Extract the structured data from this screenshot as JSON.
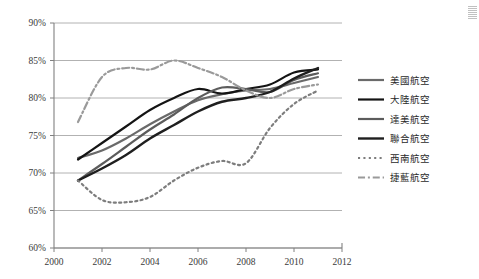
{
  "chart_data": {
    "type": "line",
    "title": "",
    "xlabel": "",
    "ylabel": "",
    "xlim": [
      2000,
      2012
    ],
    "ylim": [
      0.6,
      0.9
    ],
    "grid": true,
    "legend_position": "right",
    "x_ticks": [
      "2000",
      "2002",
      "2004",
      "2006",
      "2008",
      "2010",
      "2012"
    ],
    "x_tick_values": [
      2000,
      2002,
      2004,
      2006,
      2008,
      2010,
      2012
    ],
    "y_ticks": [
      "60%",
      "65%",
      "70%",
      "75%",
      "80%",
      "85%",
      "90%"
    ],
    "y_tick_values": [
      0.6,
      0.65,
      0.7,
      0.75,
      0.8,
      0.85,
      0.9
    ],
    "x": [
      2001,
      2002,
      2003,
      2004,
      2005,
      2006,
      2007,
      2008,
      2009,
      2010,
      2011
    ],
    "series": [
      {
        "name": "美國航空",
        "style": "solid",
        "color": "#6a6a6a",
        "width": 2.2,
        "values": [
          0.72,
          0.73,
          0.746,
          0.765,
          0.782,
          0.797,
          0.805,
          0.81,
          0.812,
          0.82,
          0.828
        ]
      },
      {
        "name": "大陸航空",
        "style": "solid",
        "color": "#141414",
        "width": 2.2,
        "values": [
          0.718,
          0.74,
          0.762,
          0.784,
          0.8,
          0.812,
          0.806,
          0.812,
          0.818,
          0.834,
          0.838
        ]
      },
      {
        "name": "達美航空",
        "style": "solid",
        "color": "#5c5c5c",
        "width": 2.2,
        "values": [
          0.69,
          0.712,
          0.735,
          0.758,
          0.778,
          0.8,
          0.814,
          0.812,
          0.808,
          0.824,
          0.833
        ]
      },
      {
        "name": "聯合航空",
        "style": "solid",
        "color": "#1f1f1f",
        "width": 2.4,
        "values": [
          0.69,
          0.706,
          0.724,
          0.746,
          0.764,
          0.782,
          0.795,
          0.8,
          0.808,
          0.826,
          0.84
        ]
      },
      {
        "name": "西南航空",
        "style": "dotted",
        "color": "#7d7d7d",
        "width": 2.2,
        "values": [
          0.69,
          0.664,
          0.661,
          0.668,
          0.69,
          0.707,
          0.716,
          0.713,
          0.76,
          0.792,
          0.81
        ]
      },
      {
        "name": "捷藍航空",
        "style": "dashdot",
        "color": "#9a9a9a",
        "width": 2.2,
        "values": [
          0.768,
          0.828,
          0.84,
          0.838,
          0.85,
          0.84,
          0.828,
          0.81,
          0.8,
          0.812,
          0.818
        ]
      }
    ]
  },
  "legend": {
    "items": [
      {
        "label": "美國航空"
      },
      {
        "label": "大陸航空"
      },
      {
        "label": "達美航空"
      },
      {
        "label": "聯合航空"
      },
      {
        "label": "西南航空"
      },
      {
        "label": "捷藍航空"
      }
    ]
  },
  "colors": {
    "axis": "#808080",
    "grid": "#9e9e9e",
    "text": "#3a3a3a",
    "background": "#ffffff"
  }
}
